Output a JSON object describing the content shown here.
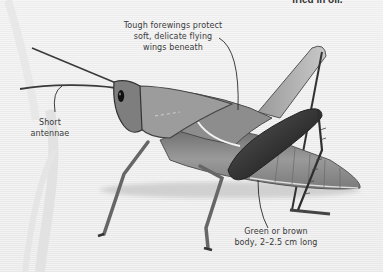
{
  "illustration": {
    "subject": "grasshopper",
    "style": "grayscale"
  },
  "corner_text": "fried in oil.",
  "labels": {
    "wings": [
      "Tough forewings protect",
      "soft, delicate flying",
      "wings beneath"
    ],
    "antennae": [
      "Short",
      "antennae"
    ],
    "body": [
      "Green or brown",
      "body, 2–2.5 cm long"
    ]
  },
  "colors": {
    "background": "#efefef",
    "label_text": "#3a3a3a",
    "leader_line": "#2a2a2a",
    "body_mid": "#8a8a8a",
    "body_dark": "#444444"
  }
}
